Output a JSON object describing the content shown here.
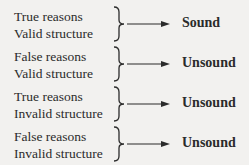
{
  "diagram": {
    "title": "",
    "rows": [
      {
        "premise1": "True reasons",
        "premise2": "Valid structure",
        "verdict": "Sound"
      },
      {
        "premise1": "False reasons",
        "premise2": "Valid structure",
        "verdict": "Unsound"
      },
      {
        "premise1": "True reasons",
        "premise2": "Invalid structure",
        "verdict": "Unsound"
      },
      {
        "premise1": "False reasons",
        "premise2": "Invalid structure",
        "verdict": "Unsound"
      }
    ],
    "colors": {
      "background": "#f2f1ef",
      "text": "#2b2b2b"
    }
  }
}
